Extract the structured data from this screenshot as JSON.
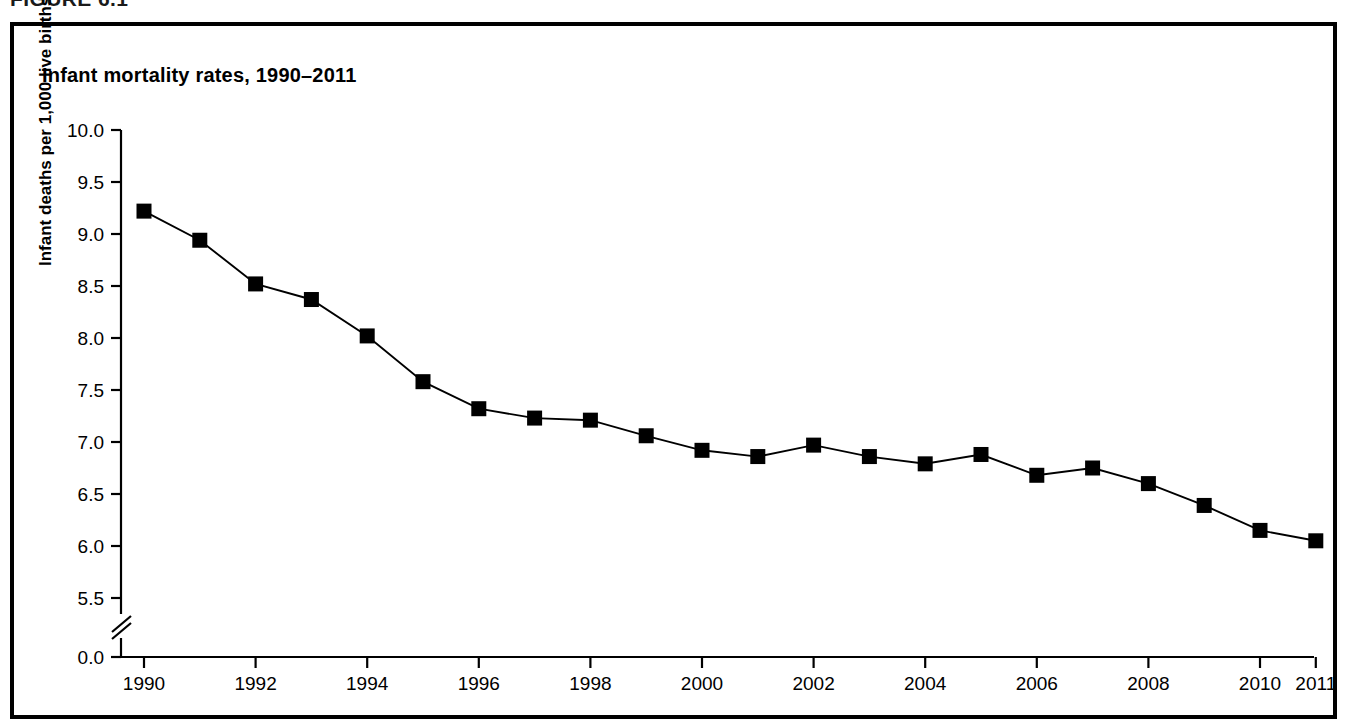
{
  "figure": {
    "caption": "FIGURE 6.1",
    "title": "Infant mortality rates, 1990–2011"
  },
  "chart_data": {
    "type": "line",
    "title": "Infant mortality rates, 1990–2011",
    "xlabel": "Year",
    "ylabel": "Infant deaths per 1,000 live births",
    "x": [
      1990,
      1991,
      1992,
      1993,
      1994,
      1995,
      1996,
      1997,
      1998,
      1999,
      2000,
      2001,
      2002,
      2003,
      2004,
      2005,
      2006,
      2007,
      2008,
      2009,
      2010,
      2011
    ],
    "values": [
      9.22,
      8.94,
      8.52,
      8.37,
      8.02,
      7.58,
      7.32,
      7.23,
      7.21,
      7.06,
      6.92,
      6.86,
      6.97,
      6.86,
      6.79,
      6.88,
      6.68,
      6.75,
      6.6,
      6.39,
      6.15,
      6.05
    ],
    "series": [
      {
        "name": "Infant mortality rate",
        "values": [
          9.22,
          8.94,
          8.52,
          8.37,
          8.02,
          7.58,
          7.32,
          7.23,
          7.21,
          7.06,
          6.92,
          6.86,
          6.97,
          6.86,
          6.79,
          6.88,
          6.68,
          6.75,
          6.6,
          6.39,
          6.15,
          6.05
        ],
        "marker": "filled-square",
        "color": "#000000"
      }
    ],
    "y_ticks": [
      "0.0",
      "5.5",
      "6.0",
      "6.5",
      "7.0",
      "7.5",
      "8.0",
      "8.5",
      "9.0",
      "9.5",
      "10.0"
    ],
    "y_tick_values": [
      0.0,
      5.5,
      6.0,
      6.5,
      7.0,
      7.5,
      8.0,
      8.5,
      9.0,
      9.5,
      10.0
    ],
    "x_ticks": [
      "1990",
      "1992",
      "1994",
      "1996",
      "1998",
      "2000",
      "2002",
      "2004",
      "2006",
      "2008",
      "2010",
      "2011"
    ],
    "x_tick_values": [
      1990,
      1992,
      1994,
      1996,
      1998,
      2000,
      2002,
      2004,
      2006,
      2008,
      2010,
      2011
    ],
    "ylim": [
      5.3,
      10.0
    ],
    "xlim": [
      1989.6,
      2011.4
    ],
    "axis_break": true,
    "axis_break_note": "y-axis broken between 0.0 and 5.5",
    "grid": false,
    "legend": null
  },
  "colors": {
    "line": "#000000",
    "marker": "#000000",
    "frame": "#000000",
    "background": "#ffffff"
  }
}
